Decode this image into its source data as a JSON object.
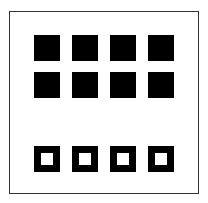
{
  "figure": {
    "colors": {
      "fill": "#000000",
      "background": "#ffffff",
      "border": "#333333"
    },
    "rows": [
      {
        "type": "filled",
        "count": 4
      },
      {
        "type": "filled",
        "count": 4
      },
      {
        "type": "hollow",
        "count": 4
      }
    ]
  }
}
